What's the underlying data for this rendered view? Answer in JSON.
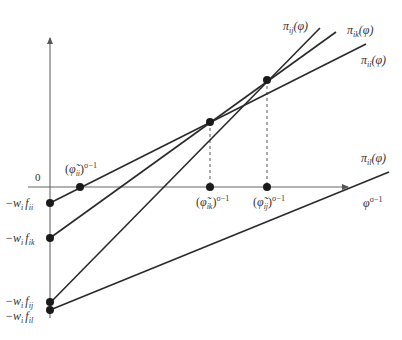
{
  "diagram": {
    "type": "profit-lines",
    "axes": {
      "x_label": "φ",
      "x_label_sup": "σ−1",
      "origin_label": "0"
    },
    "lines": [
      {
        "id": "pi_ij",
        "label_main": "π",
        "label_sub": "ij",
        "label_arg": "(φ)"
      },
      {
        "id": "pi_ik",
        "label_main": "π",
        "label_sub": "ik",
        "label_arg": "(φ)"
      },
      {
        "id": "pi_ii",
        "label_main": "π",
        "label_sub": "ii",
        "label_arg": "(φ)"
      },
      {
        "id": "pi_il",
        "label_main": "π",
        "label_sub": "il",
        "label_arg": "(φ)"
      }
    ],
    "y_intercepts": [
      {
        "id": "f_ii",
        "prefix": "−w",
        "w_sub": "i",
        "f": "f",
        "f_sub": "ii"
      },
      {
        "id": "f_ik",
        "prefix": "−w",
        "w_sub": "i",
        "f": "f",
        "f_sub": "ik"
      },
      {
        "id": "f_ij",
        "prefix": "−w",
        "w_sub": "i",
        "f": "f",
        "f_sub": "ij"
      },
      {
        "id": "f_il",
        "prefix": "−w",
        "w_sub": "i",
        "f": "f",
        "f_sub": "il"
      }
    ],
    "x_thresholds": [
      {
        "id": "phi_ii",
        "open": "(",
        "var": "φ̃",
        "sub": "ii",
        "close": ")",
        "sup": "σ−1"
      },
      {
        "id": "phi_ik",
        "open": "(",
        "var": "φ̃",
        "sub": "ik",
        "close": ")",
        "sup": "σ−1"
      },
      {
        "id": "phi_ij",
        "open": "(",
        "var": "φ̃",
        "sub": "ij",
        "close": ")",
        "sup": "σ−1"
      }
    ]
  }
}
